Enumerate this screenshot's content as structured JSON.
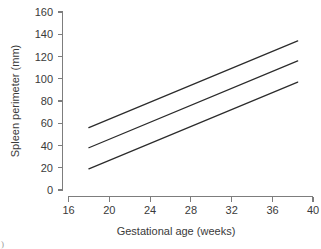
{
  "chart_data": {
    "type": "line",
    "title": "",
    "xlabel": "Gestational age (weeks)",
    "ylabel": "Spleen perimeter (mm)",
    "xlim": [
      16,
      40
    ],
    "ylim": [
      0,
      160
    ],
    "xticks": [
      16,
      20,
      24,
      28,
      32,
      36,
      40
    ],
    "yticks": [
      0,
      20,
      40,
      60,
      80,
      100,
      120,
      140,
      160
    ],
    "grid": false,
    "legend": "none",
    "x": [
      18,
      38.5
    ],
    "series": [
      {
        "name": "upper-reference-line",
        "values": [
          56,
          134
        ]
      },
      {
        "name": "mean-reference-line",
        "values": [
          38,
          116
        ]
      },
      {
        "name": "lower-reference-line",
        "values": [
          19,
          97
        ]
      }
    ]
  },
  "axes": {
    "x_title": "Gestational age (weeks)",
    "y_title": "Spleen perimeter (mm)",
    "x_tick_labels": [
      "16",
      "20",
      "24",
      "28",
      "32",
      "36",
      "40"
    ],
    "y_tick_labels": [
      "0",
      "20",
      "40",
      "60",
      "80",
      "100",
      "120",
      "140",
      "160"
    ]
  },
  "colors": {
    "line": "#2b2b2b",
    "axis": "#7d7d7d",
    "text": "#3a3a3a",
    "background": "#ffffff"
  },
  "caption": {
    "fragment": ")"
  }
}
